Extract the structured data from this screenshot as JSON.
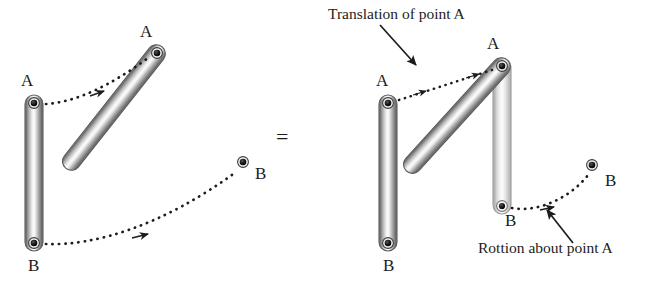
{
  "figure": {
    "equals_sign": "=",
    "background_color": "#ffffff",
    "ink_color": "#1c1c1c"
  },
  "left_panel": {
    "name": "General plane motion of rod AB",
    "rods": [
      {
        "id": "rod-initial-left",
        "shade": "dark",
        "endpoint_a_label": "A",
        "endpoint_b_label": "B",
        "a": {
          "x": 34,
          "y": 103
        },
        "b": {
          "x": 34,
          "y": 243
        }
      },
      {
        "id": "rod-final-left",
        "shade": "dark",
        "endpoint_a_label": "A",
        "endpoint_b_label": "B",
        "a": {
          "x": 157,
          "y": 53
        },
        "b": {
          "x": 243,
          "y": 162
        }
      }
    ],
    "paths": [
      {
        "id": "path-a-left",
        "label": "",
        "arrow": true
      },
      {
        "id": "path-b-left",
        "label": "",
        "arrow": true
      }
    ],
    "labels": {
      "a_initial": "A",
      "b_initial": "B",
      "a_final": "A",
      "b_final": "B"
    }
  },
  "right_panel": {
    "name": "Equivalent translation plus rotation",
    "rods": [
      {
        "id": "rod-initial-right",
        "shade": "dark",
        "endpoint_a_label": "A",
        "endpoint_b_label": "B",
        "a": {
          "x": 388,
          "y": 103
        },
        "b": {
          "x": 388,
          "y": 243
        }
      },
      {
        "id": "rod-translated-right",
        "shade": "light",
        "endpoint_a_label": "A",
        "endpoint_b_label": "B",
        "a": {
          "x": 502,
          "y": 66
        },
        "b": {
          "x": 502,
          "y": 206
        }
      },
      {
        "id": "rod-rotated-right",
        "shade": "dark",
        "endpoint_a_label": "A",
        "endpoint_b_label": "B",
        "a": {
          "x": 502,
          "y": 66
        },
        "b": {
          "x": 592,
          "y": 165
        }
      }
    ],
    "labels": {
      "a_initial": "A",
      "b_initial": "B",
      "a_shared": "A",
      "b_translated": "B",
      "b_rotated": "B"
    },
    "annotations": {
      "translation": "Translation of point A",
      "rotation": "Rottion about point A"
    }
  }
}
